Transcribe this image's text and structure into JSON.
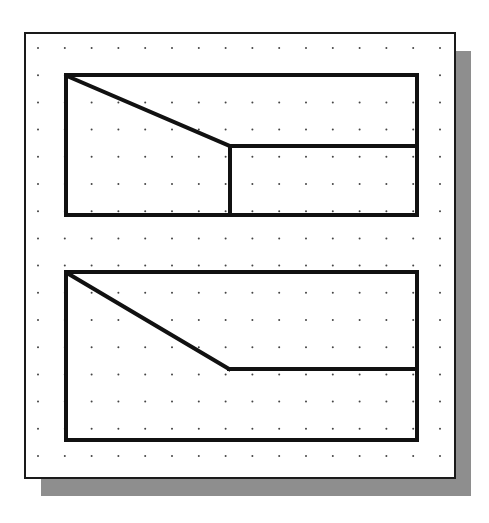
{
  "colors": {
    "background": "#ffffff",
    "frame_stroke": "#1a1a1a",
    "shape_stroke": "#111111",
    "shadow": "#8e8e8e",
    "grid_dot": "#444444"
  },
  "frame": {
    "x": 25,
    "y": 33,
    "w": 430,
    "h": 445,
    "stroke_width": 2
  },
  "shadow": {
    "offset_x": 16,
    "offset_y": 18
  },
  "grid": {
    "x0": 38,
    "y0": 48,
    "dx": 26.8,
    "dy": 27.2,
    "cols": 16,
    "rows": 16,
    "dot_r": 1
  },
  "shapes": {
    "upper": {
      "rect": {
        "x": 66,
        "y": 75,
        "w": 351,
        "h": 140
      },
      "lines": [
        {
          "x1": 67,
          "y1": 76,
          "x2": 230,
          "y2": 146
        },
        {
          "x1": 230,
          "y1": 146,
          "x2": 417,
          "y2": 146
        },
        {
          "x1": 230,
          "y1": 146,
          "x2": 230,
          "y2": 215
        }
      ]
    },
    "lower": {
      "rect": {
        "x": 66,
        "y": 272,
        "w": 351,
        "h": 168
      },
      "lines": [
        {
          "x1": 67,
          "y1": 273,
          "x2": 229,
          "y2": 369
        },
        {
          "x1": 229,
          "y1": 369,
          "x2": 417,
          "y2": 369
        }
      ]
    }
  },
  "stroke_width": 4
}
